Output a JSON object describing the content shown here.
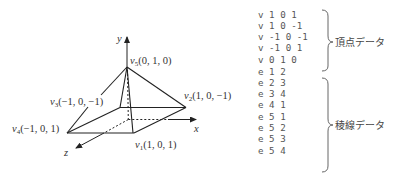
{
  "axes": {
    "x_label": "x",
    "y_label": "y",
    "z_label": "z"
  },
  "vertices": [
    {
      "name": "v",
      "sub": "1",
      "coords": "(1, 0, 1)"
    },
    {
      "name": "v",
      "sub": "2",
      "coords": "(1, 0, −1)"
    },
    {
      "name": "v",
      "sub": "3",
      "coords": "(−1, 0, −1)"
    },
    {
      "name": "v",
      "sub": "4",
      "coords": "(−1, 0, 1)"
    },
    {
      "name": "v",
      "sub": "5",
      "coords": "(0, 1, 0)"
    }
  ],
  "listing": {
    "vertex_lines": [
      "v 1 0 1",
      "v 1 0 -1",
      "v -1 0 -1",
      "v -1 0 1",
      "v 0 1 0"
    ],
    "edge_lines": [
      "e 1 2",
      "e 2 3",
      "e 3 4",
      "e 4 1",
      "e 5 1",
      "e 5 2",
      "e 5 3",
      "e 5 4"
    ],
    "vertex_group_label": "頂点データ",
    "edge_group_label": "稜線データ"
  },
  "colors": {
    "line": "#222222",
    "text": "#333333",
    "code_text": "#555555",
    "brace": "#666666"
  }
}
